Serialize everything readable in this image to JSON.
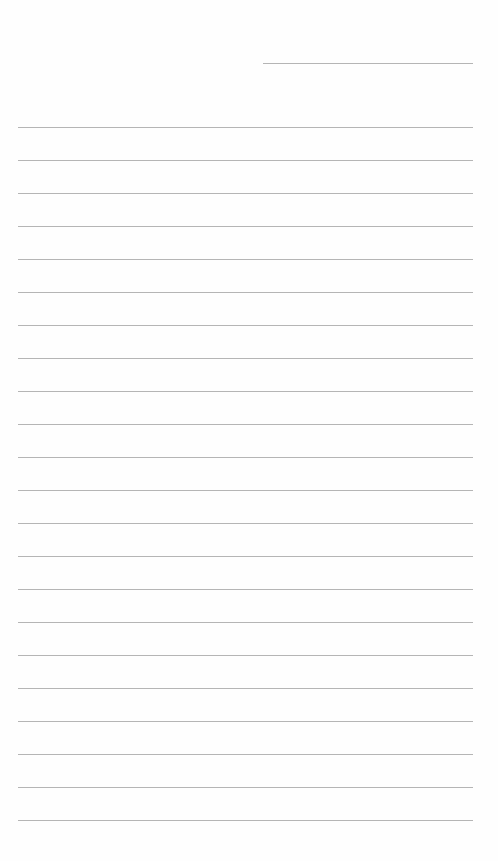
{
  "document": {
    "type": "lined-paper",
    "background_color": "#fefefe",
    "line_color": "#b5b5b5",
    "header_line": {
      "x": 263,
      "y": 63,
      "width": 210
    },
    "body_lines": {
      "count": 22,
      "x": 18,
      "width": 455,
      "first_y": 127,
      "spacing": 33
    }
  }
}
